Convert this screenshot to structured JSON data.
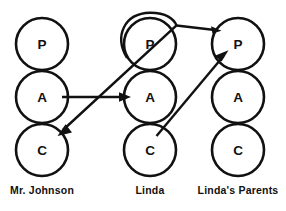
{
  "diagram": {
    "type": "ta-transaction",
    "background_color": "#ffffff",
    "stroke_color": "#111111",
    "ego_state_letters": {
      "parent": "P",
      "adult": "A",
      "child": "C"
    },
    "columns": [
      {
        "id": "mr-johnson",
        "label": "Mr. Johnson",
        "center_x": 42,
        "label_x": 42,
        "states": [
          {
            "id": "mr-johnson-parent",
            "letter": "P",
            "cx": 42,
            "cy": 44,
            "r": 26
          },
          {
            "id": "mr-johnson-adult",
            "letter": "A",
            "cx": 42,
            "cy": 97,
            "r": 26
          },
          {
            "id": "mr-johnson-child",
            "letter": "C",
            "cx": 42,
            "cy": 150,
            "r": 26
          }
        ]
      },
      {
        "id": "linda",
        "label": "Linda",
        "center_x": 150,
        "label_x": 150,
        "states": [
          {
            "id": "linda-parent",
            "letter": "P",
            "cx": 150,
            "cy": 44,
            "r": 26
          },
          {
            "id": "linda-adult",
            "letter": "A",
            "cx": 150,
            "cy": 97,
            "r": 26
          },
          {
            "id": "linda-child",
            "letter": "C",
            "cx": 150,
            "cy": 150,
            "r": 26
          }
        ]
      },
      {
        "id": "lindas-parents",
        "label": "Linda's Parents",
        "center_x": 238,
        "label_x": 238,
        "states": [
          {
            "id": "lindas-parents-parent",
            "letter": "P",
            "cx": 238,
            "cy": 44,
            "r": 26
          },
          {
            "id": "lindas-parents-adult",
            "letter": "A",
            "cx": 238,
            "cy": 97,
            "r": 26
          },
          {
            "id": "lindas-parents-child",
            "letter": "C",
            "cx": 238,
            "cy": 150,
            "r": 26
          }
        ]
      }
    ],
    "transactions": [
      {
        "id": "johnson-adult-to-linda-adult",
        "name": "adult-to-adult-arrow",
        "from": "mr-johnson-adult",
        "to": "linda-adult",
        "path": "M 62 97 L 127 97",
        "arrowhead": "M 131 97 L 120 92.5 L 120 101.5 Z"
      },
      {
        "id": "linda-parent-to-johnson-child",
        "name": "parent-to-child-curve-arrow",
        "from": "linda-parent",
        "to": "mr-johnson-child",
        "path": "M 128 56 C 118 34 128 14 151 13 C 167 13 176 20 176 26 L 62 131",
        "arrowhead": "M 58 135 L 71 132 L 65 125 Z"
      },
      {
        "id": "linda-parents-top-link",
        "name": "parents-top-connector",
        "from": "linda-parent-top",
        "to": "lindas-parents-parent",
        "path": "M 176 26 L 218 30",
        "arrowhead": "M 221 31 L 211 27 L 212 34 Z"
      },
      {
        "id": "linda-child-to-parents-parent",
        "name": "child-to-parent-arrow",
        "from": "linda-child",
        "to": "lindas-parents-parent",
        "path": "M 157 135 L 224 55",
        "arrowhead": "M 228 51 L 215 56 L 221 62 Z"
      }
    ]
  }
}
